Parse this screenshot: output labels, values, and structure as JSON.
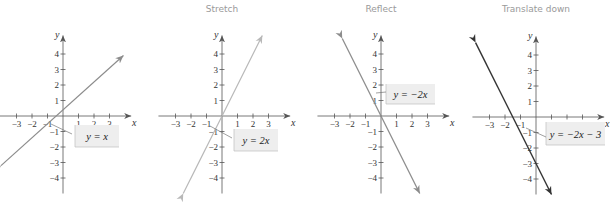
{
  "chart_data": [
    {
      "type": "line",
      "title": "",
      "xlabel": "x",
      "ylabel": "y",
      "x_ticks": [
        -3,
        -2,
        -1,
        1,
        2,
        3
      ],
      "y_ticks": [
        -4,
        -3,
        -2,
        -1,
        1,
        2,
        3,
        4
      ],
      "xlim": [
        -3.9,
        4.3
      ],
      "ylim": [
        -5.0,
        5.0
      ],
      "equation": "y = x",
      "slope": 1,
      "intercept": 0,
      "segment": {
        "x1": -4.0,
        "y1": -3.2,
        "x2": 3.9,
        "y2": 3.9
      },
      "line_color": "#8c8c8c",
      "origin_px": [
        63,
        116
      ],
      "unit_px": 15.5
    },
    {
      "type": "line",
      "title": "Stretch",
      "xlabel": "x",
      "ylabel": "y",
      "x_ticks": [
        -3,
        -2,
        -1,
        1,
        2,
        3
      ],
      "y_ticks": [
        -4,
        -3,
        -2,
        -1,
        1,
        2,
        3,
        4
      ],
      "xlim": [
        -3.9,
        4.3
      ],
      "ylim": [
        -5.0,
        5.0
      ],
      "equation": "y = 2x",
      "slope": 2,
      "intercept": 0,
      "segment": {
        "x1": -2.5,
        "y1": -5.0,
        "x2": 2.6,
        "y2": 5.2
      },
      "line_color": "#b8b8b8",
      "origin_px": [
        222,
        116
      ],
      "unit_px": 15.5
    },
    {
      "type": "line",
      "title": "Reflect",
      "xlabel": "x",
      "ylabel": "y",
      "x_ticks": [
        -3,
        -2,
        -1,
        1,
        2,
        3
      ],
      "y_ticks": [
        -4,
        -3,
        -2,
        -1,
        1,
        2,
        3,
        4
      ],
      "xlim": [
        -3.9,
        4.3
      ],
      "ylim": [
        -5.0,
        5.0
      ],
      "equation": "y = −2x",
      "slope": -2,
      "intercept": 0,
      "segment": {
        "x1": -2.5,
        "y1": 5.0,
        "x2": 2.5,
        "y2": -5.0
      },
      "line_color": "#8c8c8c",
      "origin_px": [
        381,
        116
      ],
      "unit_px": 15.5
    },
    {
      "type": "line",
      "title": "Translate down",
      "xlabel": "x",
      "ylabel": "y",
      "x_ticks": [
        -3,
        -2,
        -1,
        1,
        2,
        3
      ],
      "y_ticks": [
        -4,
        -3,
        -2,
        -1,
        1,
        2,
        3,
        4
      ],
      "xlim": [
        -3.9,
        4.3
      ],
      "ylim": [
        -5.0,
        5.0
      ],
      "equation": "y = −2x − 3",
      "slope": -2,
      "intercept": -3,
      "segment": {
        "x1": -3.9,
        "y1": 4.8,
        "x2": 1.0,
        "y2": -5.0
      },
      "line_color": "#333333",
      "origin_px": [
        536,
        117
      ],
      "unit_px": 15.5
    }
  ],
  "panels": [
    {
      "title": "",
      "equation": "y = x",
      "axis_x": "x",
      "axis_y": "y"
    },
    {
      "title": "Stretch",
      "equation": "y = 2x",
      "axis_x": "x",
      "axis_y": "y"
    },
    {
      "title": "Reflect",
      "equation": "y = −2x",
      "axis_x": "x",
      "axis_y": "y"
    },
    {
      "title": "Translate down",
      "equation": "y = −2x − 3",
      "axis_x": "x",
      "axis_y": "y"
    }
  ],
  "tick_labels": {
    "x": [
      "−3",
      "−2",
      "−1",
      "1",
      "2",
      "3"
    ],
    "y": [
      "4",
      "3",
      "2",
      "1",
      "−1",
      "−2",
      "−3",
      "−4"
    ]
  },
  "colors": {
    "axis": "#555555",
    "label_box_fill": "#eeeeee",
    "label_box_edge": "#bdbdbd",
    "title": "#9a9a9a"
  }
}
